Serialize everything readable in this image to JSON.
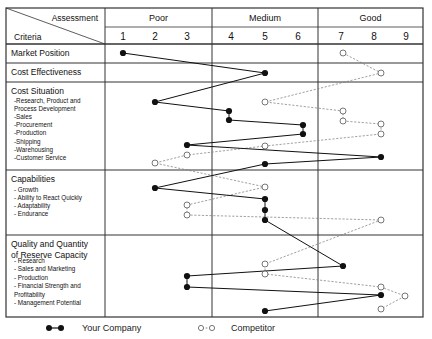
{
  "chart_data": {
    "type": "line",
    "title": "",
    "header": {
      "assessment_label": "Assessment",
      "criteria_label": "Criteria",
      "groups": [
        {
          "label": "Poor",
          "scores": [
            1,
            2,
            3
          ]
        },
        {
          "label": "Medium",
          "scores": [
            4,
            5,
            6
          ]
        },
        {
          "label": "Good",
          "scores": [
            7,
            8,
            9
          ]
        }
      ]
    },
    "x_scale": [
      1,
      2,
      3,
      4,
      5,
      6,
      7,
      8,
      9
    ],
    "sections": [
      {
        "title": "Market Position",
        "items": [],
        "points": [
          {
            "y": 53,
            "your_company": 1,
            "competitor": 7
          }
        ]
      },
      {
        "title": "Cost Effectiveness",
        "items": [],
        "points": [
          {
            "y": 73,
            "your_company": 5,
            "competitor": 8
          }
        ]
      },
      {
        "title": "Cost Situation",
        "items": [
          "-Research, Product and",
          " Process Development",
          "-Sales",
          "-Procurement",
          "-Production",
          "-Shipping",
          "-Warehousing",
          "-Customer Service"
        ],
        "points": [
          {
            "item": "Research, Product and Process Development",
            "your_company": 2,
            "competitor": 5
          },
          {
            "item": "Sales",
            "your_company": 4,
            "competitor": 7
          },
          {
            "item": "Procurement",
            "your_company": 4,
            "competitor": 7
          },
          {
            "item": "Production",
            "your_company": 6,
            "competitor": 8
          },
          {
            "item": "Shipping",
            "your_company": 6,
            "competitor": 8
          },
          {
            "item": "Warehousing",
            "your_company": 3,
            "competitor": 5
          },
          {
            "item": "Customer Service",
            "your_company": 8,
            "competitor": 3
          },
          {
            "item": "Customer Service (2)",
            "your_company": 5,
            "competitor": 2
          }
        ]
      },
      {
        "title": "Capabilities",
        "items": [
          "- Growth",
          "- Ability to React Quickly",
          "- Adaptability",
          "- Endurance"
        ],
        "points": [
          {
            "item": "Growth",
            "your_company": 2,
            "competitor": 5
          },
          {
            "item": "Ability to React Quickly",
            "your_company": 5,
            "competitor": 3
          },
          {
            "item": "Adaptability",
            "your_company": 5,
            "competitor": 3
          },
          {
            "item": "Endurance",
            "your_company": 5,
            "competitor": 8
          }
        ]
      },
      {
        "title": "Quality and Quantity of Reserve Capacity",
        "title_lines": [
          "Quality and Quantity",
          "of Reserve Capacity"
        ],
        "items": [
          "- Research",
          "- Sales and Marketing",
          "- Production",
          "- Financial Strength and",
          "  Profitability",
          "- Management Potential"
        ],
        "points": [
          {
            "item": "Research",
            "your_company": 7,
            "competitor": 5
          },
          {
            "item": "Sales and Marketing",
            "your_company": 3,
            "competitor": 5
          },
          {
            "item": "Production",
            "your_company": 3,
            "competitor": 8
          },
          {
            "item": "Financial Strength and Profitability",
            "your_company": 8,
            "competitor": 9
          },
          {
            "item": "Management Potential",
            "your_company": 5,
            "competitor": 8
          }
        ]
      }
    ],
    "series": [
      {
        "name": "Your Company",
        "style": "solid line, filled circles",
        "color": "#111111",
        "values": [
          1,
          5,
          2,
          4,
          4,
          6,
          6,
          3,
          8,
          5,
          2,
          5,
          5,
          5,
          7,
          3,
          3,
          8,
          5
        ]
      },
      {
        "name": "Competitor",
        "style": "dashed line, open circles",
        "color": "#777777",
        "values": [
          7,
          8,
          5,
          7,
          7,
          8,
          8,
          5,
          3,
          2,
          5,
          3,
          3,
          8,
          5,
          5,
          8,
          9,
          8
        ]
      }
    ],
    "legend": {
      "position": "bottom",
      "entries": [
        "Your Company",
        "Competitor"
      ]
    }
  },
  "legend": {
    "your_company": "Your Company",
    "competitor": "Competitor"
  }
}
